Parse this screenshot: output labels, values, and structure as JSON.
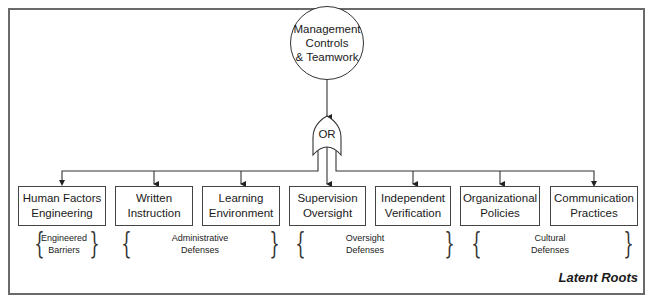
{
  "diagram": {
    "type": "fault-tree",
    "root": {
      "lines": [
        "Management",
        "Controls",
        "& Teamwork"
      ]
    },
    "gate": {
      "type": "OR",
      "label": "OR"
    },
    "children": [
      {
        "id": "human-factors-engineering",
        "lines": [
          "Human Factors",
          "Engineering"
        ]
      },
      {
        "id": "written-instruction",
        "lines": [
          "Written",
          "Instruction"
        ]
      },
      {
        "id": "learning-environment",
        "lines": [
          "Learning",
          "Environment"
        ]
      },
      {
        "id": "supervision-oversight",
        "lines": [
          "Supervision",
          "Oversight"
        ]
      },
      {
        "id": "independent-verification",
        "lines": [
          "Independent",
          "Verification"
        ]
      },
      {
        "id": "organizational-policies",
        "lines": [
          "Organizational",
          "Policies"
        ]
      },
      {
        "id": "communication-practices",
        "lines": [
          "Communication",
          "Practices"
        ]
      }
    ],
    "groups": [
      {
        "id": "engineered-barriers",
        "lines": [
          "Engineered",
          "Barriers"
        ],
        "covers": [
          "human-factors-engineering"
        ]
      },
      {
        "id": "administrative-defenses",
        "lines": [
          "Administrative",
          "Defenses"
        ],
        "covers": [
          "written-instruction",
          "learning-environment"
        ]
      },
      {
        "id": "oversight-defenses",
        "lines": [
          "Oversight",
          "Defenses"
        ],
        "covers": [
          "supervision-oversight",
          "independent-verification"
        ]
      },
      {
        "id": "cultural-defenses",
        "lines": [
          "Cultural",
          "Defenses"
        ],
        "covers": [
          "organizational-policies",
          "communication-practices"
        ]
      }
    ],
    "brace_open": "{",
    "brace_close": "}",
    "caption": "Latent Roots"
  }
}
